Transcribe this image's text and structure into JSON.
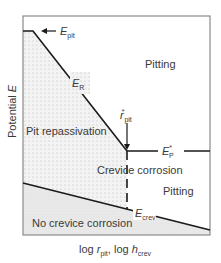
{
  "diagram": {
    "type": "potential-vs-log-dimension phase diagram",
    "y_axis_label": {
      "prefix": "Potential ",
      "symbol": "E"
    },
    "x_axis_label": {
      "part1_prefix": "log ",
      "part1_symbol": "r",
      "part1_sub": "pit",
      "separator": ", ",
      "part2_prefix": "log ",
      "part2_symbol": "h",
      "part2_sub": "crev"
    },
    "curves": {
      "e_pit": {
        "symbol": "E",
        "sub": "pit"
      },
      "e_r": {
        "symbol": "E",
        "sub": "R"
      },
      "e_p_star": {
        "symbol": "E",
        "sub": "P",
        "sup": "*"
      },
      "e_crev": {
        "symbol": "E",
        "sub": "crev"
      },
      "r_pit_star": {
        "symbol": "r",
        "sub": "pit",
        "sup": "*"
      }
    },
    "regions": {
      "pitting_upper": "Pitting",
      "pit_repassivation": "Pit repassivation",
      "crevice_corrosion": "Crevice corrosion",
      "pitting_lower": "Pitting",
      "no_crevice_corrosion": "No crevice corrosion"
    },
    "colors": {
      "line": "#1a1a1a",
      "frame": "#8a8a8a",
      "dotted_fill_dot": "#b5b5b5",
      "lower_fill": "#ececec",
      "text": "#3a3a3a"
    }
  }
}
